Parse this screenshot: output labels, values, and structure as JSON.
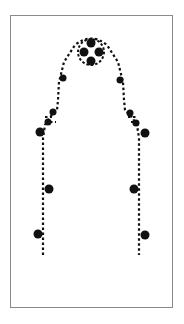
{
  "diagram": {
    "type": "dotted-outline-with-markers",
    "frame": {
      "x": 10,
      "y": 15,
      "width": 163,
      "height": 293,
      "stroke": "#8a8a8a"
    },
    "outline_color": "#111111",
    "marker_color": "#111111",
    "top_cluster": {
      "cx": 91,
      "cy": 52,
      "r": 13,
      "dots": [
        {
          "cx": 91,
          "cy": 43,
          "r": 4.5
        },
        {
          "cx": 84,
          "cy": 52,
          "r": 4.5
        },
        {
          "cx": 99,
          "cy": 52,
          "r": 4.5
        },
        {
          "cx": 91,
          "cy": 61,
          "r": 4.5
        }
      ]
    },
    "markers": [
      {
        "cx": 63,
        "cy": 78,
        "r": 3.5
      },
      {
        "cx": 120,
        "cy": 80,
        "r": 3.5
      },
      {
        "cx": 53,
        "cy": 112,
        "r": 3.5
      },
      {
        "cx": 48,
        "cy": 122,
        "r": 3.5
      },
      {
        "cx": 130,
        "cy": 113,
        "r": 3.5
      },
      {
        "cx": 136,
        "cy": 123,
        "r": 3.5
      },
      {
        "cx": 40,
        "cy": 132,
        "r": 4.5
      },
      {
        "cx": 145,
        "cy": 133,
        "r": 4.5
      },
      {
        "cx": 49,
        "cy": 189,
        "r": 4.5
      },
      {
        "cx": 134,
        "cy": 189,
        "r": 4.5
      },
      {
        "cx": 38,
        "cy": 234,
        "r": 4.5
      },
      {
        "cx": 145,
        "cy": 235,
        "r": 4.5
      }
    ]
  }
}
